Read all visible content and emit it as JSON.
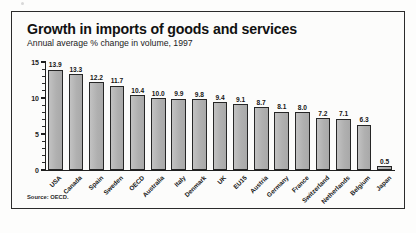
{
  "figure": {
    "title": "Growth in imports of goods and services",
    "subtitle": "Annual average % change in volume, 1997",
    "source": "Source: OECD."
  },
  "colors": {
    "bar_fill": "#b4b4b4",
    "bar_edge": "#262626",
    "frame": "#2b2b2b",
    "text": "#111111",
    "background": "#fcfcfb"
  },
  "chart_data": {
    "type": "bar",
    "title": "Growth in imports of goods and services",
    "subtitle": "Annual average % change in volume, 1997",
    "xlabel": "",
    "ylabel": "",
    "ylim": [
      0,
      15
    ],
    "yticks": [
      0,
      5,
      10,
      15
    ],
    "ytick_labels": [
      "0",
      "5",
      "10",
      "15"
    ],
    "minor_tick_interval": 1,
    "grid": false,
    "legend": "none",
    "value_labels": true,
    "source": "Source: OECD.",
    "categories": [
      "USA",
      "Canada",
      "Spain",
      "Sweden",
      "OECD",
      "Australia",
      "Italy",
      "Denmark",
      "UK",
      "EU15",
      "Austria",
      "Germany",
      "France",
      "Switzerland",
      "Netherlands",
      "Belgium",
      "Japan"
    ],
    "values": [
      13.9,
      13.3,
      12.2,
      11.7,
      10.4,
      10.0,
      9.9,
      9.8,
      9.4,
      9.1,
      8.7,
      8.1,
      8.0,
      7.2,
      7.1,
      6.3,
      0.5
    ],
    "value_label_text": [
      "13.9",
      "13.3",
      "12.2",
      "11.7",
      "10.4",
      "10.0",
      "9.9",
      "9.8",
      "9.4",
      "9.1",
      "8.7",
      "8.1",
      "8.0",
      "7.2",
      "7.1",
      "6.3",
      "0.5"
    ]
  }
}
